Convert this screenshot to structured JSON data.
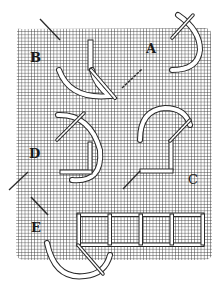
{
  "figure": {
    "colors": {
      "background": "#ffffff",
      "grid": "#3a3a3a",
      "thread_fill": "#ffffff",
      "thread_outline": "#2a2a2a",
      "needle": "#2a2a2a",
      "label": "#1a1a1a"
    },
    "grid": {
      "x": 15,
      "y": 28,
      "width": 197,
      "height": 232,
      "spacing": 3.2
    },
    "labels": [
      {
        "id": "A",
        "text": "A",
        "x": 146,
        "y": 42
      },
      {
        "id": "B",
        "text": "B",
        "x": 30,
        "y": 51
      },
      {
        "id": "C",
        "text": "C",
        "x": 188,
        "y": 173
      },
      {
        "id": "D",
        "text": "D",
        "x": 29,
        "y": 147
      },
      {
        "id": "E",
        "text": "E",
        "x": 31,
        "y": 221
      }
    ]
  }
}
